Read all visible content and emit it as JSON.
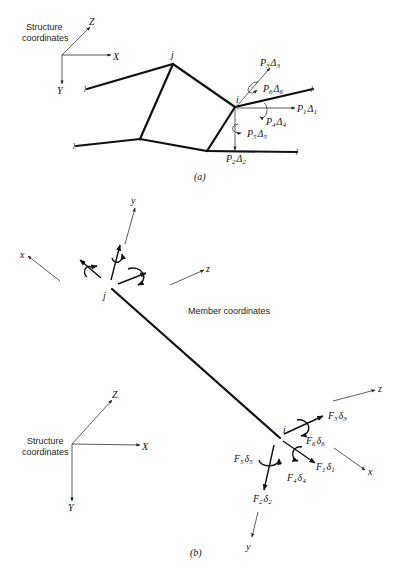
{
  "part_a": {
    "caption": "(a)",
    "axes_label_line1": "Structure",
    "axes_label_line2": "coordinates",
    "axis_x": "X",
    "axis_y": "Y",
    "axis_z": "Z",
    "node_j": "j",
    "node_i": "i",
    "loads": [
      {
        "P": "P",
        "ps": "3",
        "D": "Δ",
        "ds": "3"
      },
      {
        "P": "P",
        "ps": "6",
        "D": "Δ",
        "ds": "6"
      },
      {
        "P": "P",
        "ps": "1",
        "D": "Δ",
        "ds": "1"
      },
      {
        "P": "P",
        "ps": "4",
        "D": "Δ",
        "ds": "4"
      },
      {
        "P": "P",
        "ps": "5",
        "D": "Δ",
        "ds": "5"
      },
      {
        "P": "P",
        "ps": "2",
        "D": "Δ",
        "ds": "2"
      }
    ]
  },
  "part_b": {
    "caption": "(b)",
    "member_label": "Member coordinates",
    "axes_label_line1": "Structure",
    "axes_label_line2": "coordinates",
    "axis_x": "X",
    "axis_y": "Y",
    "axis_z": "Z",
    "member_x": "x",
    "member_y": "y",
    "member_z": "z",
    "node_j": "j",
    "node_i": "i",
    "forces": [
      {
        "F": "F",
        "fs": "3",
        "d": "δ",
        "ds": "3"
      },
      {
        "F": "F",
        "fs": "6",
        "d": "δ",
        "ds": "6"
      },
      {
        "F": "F",
        "fs": "1",
        "d": "δ",
        "ds": "1"
      },
      {
        "F": "F",
        "fs": "4",
        "d": "δ",
        "ds": "4"
      },
      {
        "F": "F",
        "fs": "5",
        "d": "δ",
        "ds": "5"
      },
      {
        "F": "F",
        "fs": "2",
        "d": "δ",
        "ds": "2"
      }
    ]
  }
}
